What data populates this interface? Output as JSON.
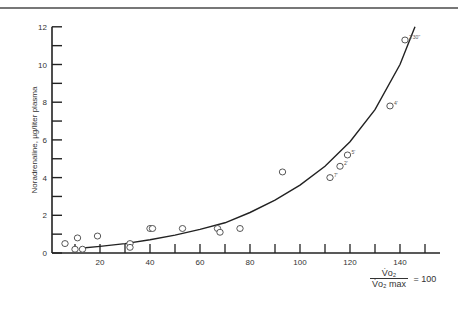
{
  "chart_data": {
    "type": "scatter",
    "title": "",
    "xlabel": "V̇o2 / V̇o2 max = 100",
    "ylabel": "Noradrenaline, µg/liter plasma",
    "xlim": [
      0,
      155
    ],
    "ylim": [
      0,
      12
    ],
    "x_ticks": [
      20,
      40,
      60,
      80,
      100,
      120,
      140
    ],
    "x_minor_ticks": [
      10,
      30,
      50,
      70,
      90,
      110,
      130,
      150
    ],
    "y_ticks": [
      0,
      2,
      4,
      6,
      8,
      10,
      12
    ],
    "y_minor_ticks": [
      1,
      3,
      5,
      7,
      9,
      11
    ],
    "grid": false,
    "series": [
      {
        "name": "observations",
        "marker": "open-circle",
        "points": [
          {
            "x": 6,
            "y": 0.5,
            "label": ""
          },
          {
            "x": 11,
            "y": 0.8,
            "label": ""
          },
          {
            "x": 10,
            "y": 0.2,
            "label": ""
          },
          {
            "x": 13,
            "y": 0.2,
            "label": ""
          },
          {
            "x": 19,
            "y": 0.9,
            "label": ""
          },
          {
            "x": 32,
            "y": 0.5,
            "label": ""
          },
          {
            "x": 32,
            "y": 0.3,
            "label": ""
          },
          {
            "x": 40,
            "y": 1.3,
            "label": ""
          },
          {
            "x": 41,
            "y": 1.3,
            "label": ""
          },
          {
            "x": 53,
            "y": 1.3,
            "label": ""
          },
          {
            "x": 67,
            "y": 1.3,
            "label": ""
          },
          {
            "x": 68,
            "y": 1.1,
            "label": ""
          },
          {
            "x": 76,
            "y": 1.3,
            "label": ""
          },
          {
            "x": 93,
            "y": 4.3,
            "label": ""
          },
          {
            "x": 112,
            "y": 4.0,
            "label": "7'"
          },
          {
            "x": 116,
            "y": 4.6,
            "label": "2'"
          },
          {
            "x": 119,
            "y": 5.2,
            "label": "5'"
          },
          {
            "x": 136,
            "y": 7.8,
            "label": "4'"
          },
          {
            "x": 142,
            "y": 11.3,
            "label": "2'30''"
          }
        ]
      },
      {
        "name": "fitted curve",
        "type": "line",
        "points": [
          {
            "x": 12,
            "y": 0.25
          },
          {
            "x": 20,
            "y": 0.35
          },
          {
            "x": 30,
            "y": 0.5
          },
          {
            "x": 40,
            "y": 0.7
          },
          {
            "x": 50,
            "y": 0.95
          },
          {
            "x": 60,
            "y": 1.25
          },
          {
            "x": 70,
            "y": 1.6
          },
          {
            "x": 80,
            "y": 2.15
          },
          {
            "x": 90,
            "y": 2.8
          },
          {
            "x": 100,
            "y": 3.6
          },
          {
            "x": 110,
            "y": 4.6
          },
          {
            "x": 120,
            "y": 5.9
          },
          {
            "x": 130,
            "y": 7.6
          },
          {
            "x": 140,
            "y": 10.0
          },
          {
            "x": 146,
            "y": 12.0
          }
        ]
      }
    ]
  },
  "labels": {
    "y_axis": "Noradrenaline, µg/liter plasma",
    "x_num": "V̇o₂",
    "x_den": "V̇o₂ max",
    "x_eq": "= 100"
  }
}
